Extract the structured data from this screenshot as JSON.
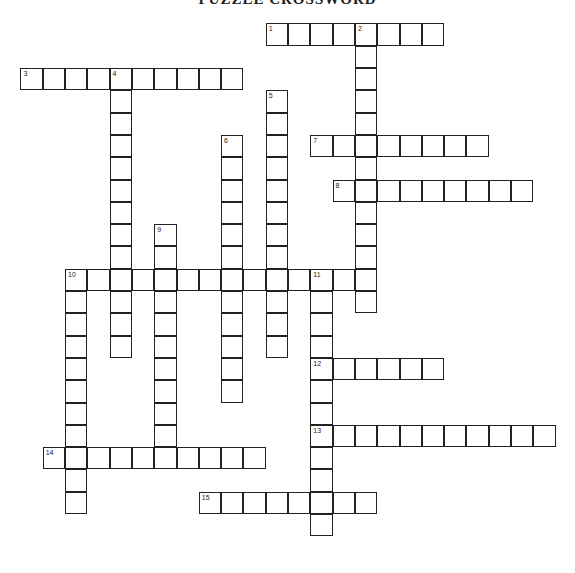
{
  "title": "PUZZLE CROSSWORD",
  "grid": {
    "origin_x": 21,
    "origin_y": 24,
    "cell_size": 22.3
  },
  "words": [
    {
      "number": "1",
      "direction": "across",
      "col": 11,
      "row": 0,
      "length": 8
    },
    {
      "number": "2",
      "direction": "down",
      "col": 15,
      "row": 0,
      "length": 13
    },
    {
      "number": "3",
      "direction": "across",
      "col": 0,
      "row": 2,
      "length": 10
    },
    {
      "number": "4",
      "direction": "down",
      "col": 4,
      "row": 2,
      "length": 13
    },
    {
      "number": "5",
      "direction": "down",
      "col": 11,
      "row": 3,
      "length": 12
    },
    {
      "number": "6",
      "direction": "down",
      "col": 9,
      "row": 5,
      "length": 12
    },
    {
      "number": "7",
      "direction": "across",
      "col": 13,
      "row": 5,
      "length": 8
    },
    {
      "number": "8",
      "direction": "across",
      "col": 14,
      "row": 7,
      "length": 9
    },
    {
      "number": "9",
      "direction": "down",
      "col": 6,
      "row": 9,
      "length": 11
    },
    {
      "number": "10",
      "direction": "across",
      "col": 2,
      "row": 11,
      "length": 14
    },
    {
      "number": "10",
      "direction": "down",
      "col": 2,
      "row": 11,
      "length": 11
    },
    {
      "number": "11",
      "direction": "down",
      "col": 13,
      "row": 11,
      "length": 12
    },
    {
      "number": "12",
      "direction": "across",
      "col": 13,
      "row": 15,
      "length": 6
    },
    {
      "number": "13",
      "direction": "across",
      "col": 13,
      "row": 18,
      "length": 11
    },
    {
      "number": "14",
      "direction": "across",
      "col": 1,
      "row": 19,
      "length": 10
    },
    {
      "number": "15",
      "direction": "across",
      "col": 8,
      "row": 21,
      "length": 8
    }
  ]
}
